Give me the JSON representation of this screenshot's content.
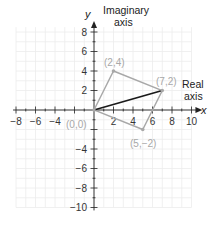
{
  "diagram": {
    "type": "complex-plane-parallelogram",
    "x_axis": {
      "variable": "x",
      "title_line1": "Real",
      "title_line2": "axis",
      "range": [
        -8,
        10
      ],
      "tick_labels": [
        "−8",
        "−6",
        "−4",
        "2",
        "4",
        "6",
        "8",
        "10"
      ],
      "tick_values": [
        -8,
        -6,
        -4,
        2,
        4,
        6,
        8,
        10
      ]
    },
    "y_axis": {
      "variable": "y",
      "title_line1": "Imaginary",
      "title_line2": "axis",
      "range": [
        -10,
        8
      ],
      "tick_labels": [
        "8",
        "6",
        "4",
        "2",
        "−4",
        "−6",
        "−8",
        "−10"
      ],
      "tick_values": [
        8,
        6,
        4,
        2,
        -4,
        -6,
        -8,
        -10
      ]
    },
    "points": [
      {
        "label": "(0,0)",
        "x": 0,
        "y": 0
      },
      {
        "label": "(2,4)",
        "x": 2,
        "y": 4
      },
      {
        "label": "(7,2)",
        "x": 7,
        "y": 2
      },
      {
        "label": "(5,−2)",
        "x": 5,
        "y": -2
      }
    ],
    "parallelogram": [
      [
        0,
        0
      ],
      [
        2,
        4
      ],
      [
        7,
        2
      ],
      [
        5,
        -2
      ]
    ],
    "diagonal": {
      "from": [
        0,
        0
      ],
      "to": [
        7,
        2
      ]
    },
    "colors": {
      "grid": "#ececec",
      "axis": "#222222",
      "parallelogram": "#a8a8a8",
      "diagonal": "#1a1a1a",
      "point_label": "#a8a8a8"
    }
  }
}
